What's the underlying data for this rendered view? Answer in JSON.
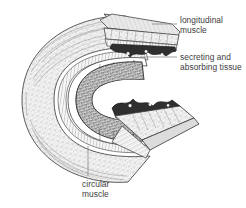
{
  "figure": {
    "name": "gut-wall-cutaway-diagram",
    "style": "grayscale stipple and hatch line drawing",
    "background_color": "#ffffff",
    "ink_color": "#3a3a3a",
    "line_color": "#8a8a8a"
  },
  "labels": {
    "longitudinal": {
      "line1": "longitudinal",
      "line2": "muscle",
      "leader": "horizontal-line-left"
    },
    "secreting": {
      "line1": "secreting and",
      "line2": "absorbing tissue",
      "leader": "horizontal-line-left"
    },
    "circular": {
      "line1": "circular",
      "line2": "muscle",
      "leader": "vertical-line-up"
    }
  },
  "layers": {
    "outer_serosa": "fine hatched outer coat",
    "longitudinal_muscle": "outer speckled muscle band",
    "circular_muscle": "inner hatched circular band",
    "submucosa": "white band",
    "mucosa": "dark stippled secreting and absorbing tissue",
    "lumen": "white open interior"
  }
}
